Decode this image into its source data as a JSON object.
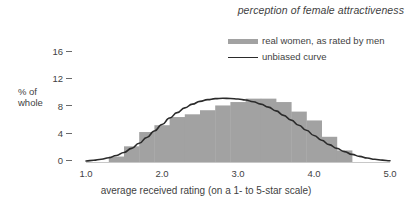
{
  "chart_data": {
    "type": "bar",
    "title": "perception of female attractiveness",
    "xlabel": "average received rating (on a 1- to 5-star scale)",
    "ylabel": "% of\nwhole",
    "ylabel_line1": "% of",
    "ylabel_line2": "whole",
    "xlim": [
      1.0,
      5.0
    ],
    "ylim": [
      0,
      17.5
    ],
    "grid": false,
    "legend_position": "top-right",
    "xticks": [
      "1.0",
      "2.0",
      "3.0",
      "4.0",
      "5.0"
    ],
    "xtick_values": [
      1.0,
      2.0,
      3.0,
      4.0,
      5.0
    ],
    "yticks": [
      "0",
      "4",
      "8",
      "12",
      "16"
    ],
    "ytick_values": [
      0,
      4,
      8,
      12,
      16
    ],
    "series": [
      {
        "name": "real women, as rated by men",
        "kind": "bar",
        "color": "#a2a2a2",
        "bin_width": 0.2,
        "bin_starts": [
          1.3,
          1.5,
          1.7,
          1.9,
          2.1,
          2.3,
          2.5,
          2.7,
          2.9,
          3.1,
          3.3,
          3.5,
          3.7,
          3.9,
          4.1,
          4.3
        ],
        "values": [
          0.8,
          2.3,
          4.4,
          5.4,
          6.6,
          7.0,
          7.6,
          8.3,
          8.8,
          9.3,
          9.3,
          8.8,
          7.4,
          6.1,
          3.7,
          1.7
        ]
      },
      {
        "name": "unbiased curve",
        "kind": "line",
        "color": "#2b2b2b",
        "x": [
          1.0,
          1.1,
          1.2,
          1.3,
          1.4,
          1.5,
          1.6,
          1.7,
          1.8,
          1.9,
          2.0,
          2.1,
          2.2,
          2.3,
          2.4,
          2.5,
          2.6,
          2.7,
          2.8,
          2.9,
          3.0,
          3.1,
          3.2,
          3.3,
          3.4,
          3.5,
          3.6,
          3.7,
          3.8,
          3.9,
          4.0,
          4.1,
          4.2,
          4.3,
          4.4,
          4.5,
          4.6,
          4.7,
          4.8,
          4.9,
          5.0
        ],
        "y": [
          0.15,
          0.25,
          0.4,
          0.62,
          0.95,
          1.4,
          2.0,
          2.75,
          3.6,
          4.55,
          5.5,
          6.45,
          7.25,
          7.95,
          8.5,
          8.9,
          9.15,
          9.3,
          9.35,
          9.33,
          9.25,
          9.1,
          8.85,
          8.5,
          8.05,
          7.5,
          6.85,
          6.15,
          5.4,
          4.65,
          3.9,
          3.2,
          2.55,
          2.0,
          1.52,
          1.12,
          0.82,
          0.58,
          0.4,
          0.27,
          0.18
        ]
      }
    ]
  },
  "legend": {
    "items": [
      {
        "label": "real women, as rated by men",
        "marker": "bar-swatch"
      },
      {
        "label": "unbiased curve",
        "marker": "line-swatch"
      }
    ]
  },
  "axes": {
    "y_label_line1": "% of",
    "y_label_line2": "whole"
  },
  "colors": {
    "bar": "#a2a2a2",
    "curve": "#2b2b2b",
    "text": "#3f3f3f",
    "background": "#ffffff"
  }
}
